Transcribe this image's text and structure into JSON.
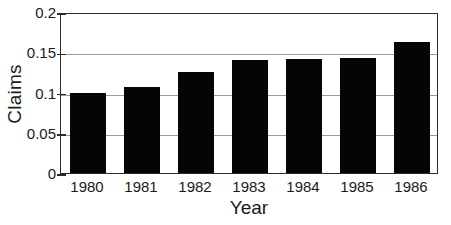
{
  "chart_data": {
    "type": "bar",
    "title": "",
    "subtitle": "",
    "xlabel": "Year",
    "ylabel": "Claims",
    "categories": [
      "1980",
      "1981",
      "1982",
      "1983",
      "1984",
      "1985",
      "1986"
    ],
    "values": [
      0.1,
      0.107,
      0.125,
      0.14,
      0.142,
      0.143,
      0.163
    ],
    "series": [
      {
        "name": "Claims",
        "values": [
          0.1,
          0.107,
          0.125,
          0.14,
          0.142,
          0.143,
          0.163
        ]
      }
    ],
    "ylim": [
      0,
      0.2
    ],
    "yticks": [
      0,
      0.05,
      0.1,
      0.15,
      0.2
    ],
    "ytick_labels": [
      "0",
      "0.05",
      "0.1",
      "0.15",
      "0.2"
    ],
    "grid": "horizontal",
    "legend": "none",
    "bar_color": "#050505",
    "axis_color": "#2b2b2b",
    "grid_color": "#9a9a9a",
    "background_color": "#ffffff"
  }
}
